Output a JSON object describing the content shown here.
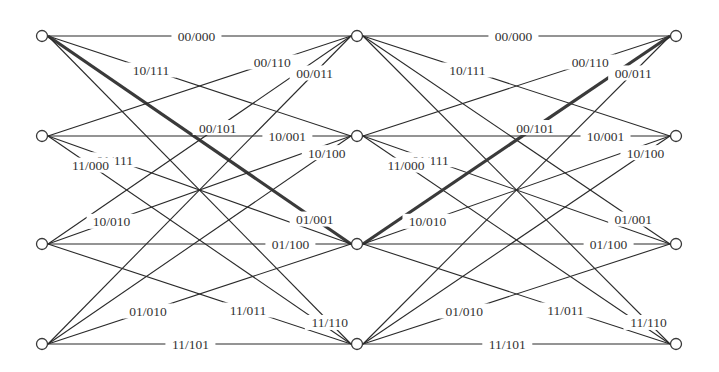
{
  "diagram": {
    "type": "trellis",
    "states": [
      "S0",
      "S1",
      "S2",
      "S3"
    ],
    "columns": [
      {
        "x": 42,
        "label": "t0"
      },
      {
        "x": 357,
        "label": "t1"
      },
      {
        "x": 676,
        "label": "t2"
      }
    ],
    "rows_y": [
      36,
      136,
      244,
      344
    ],
    "colors": {
      "line": "#2a2a2a",
      "text": "#333333",
      "node_fill": "#ffffff"
    },
    "transitions": [
      {
        "from": 0,
        "to": 0,
        "label": "00/000",
        "t": 0.49
      },
      {
        "from": 0,
        "to": 1,
        "label": "10/111",
        "t": 0.34
      },
      {
        "from": 0,
        "to": 2,
        "label": "01/001",
        "t": 0.88
      },
      {
        "from": 0,
        "to": 3,
        "label": "11/110",
        "t": 0.93
      },
      {
        "from": 1,
        "to": 0,
        "label": "00/110",
        "t": 0.74
      },
      {
        "from": 1,
        "to": 1,
        "label": "10/001",
        "t": 0.79
      },
      {
        "from": 1,
        "to": 2,
        "label": "01/111",
        "t": 0.22
      },
      {
        "from": 1,
        "to": 3,
        "label": "11/000",
        "t": 0.14
      },
      {
        "from": 2,
        "to": 0,
        "label": "00/101",
        "t": 0.56
      },
      {
        "from": 2,
        "to": 1,
        "label": "10/010",
        "t": 0.21
      },
      {
        "from": 2,
        "to": 2,
        "label": "01/100",
        "t": 0.8
      },
      {
        "from": 2,
        "to": 3,
        "label": "11/011",
        "t": 0.66
      },
      {
        "from": 3,
        "to": 0,
        "label": "00/011",
        "t": 0.88
      },
      {
        "from": 3,
        "to": 1,
        "label": "10/100",
        "t": 0.92
      },
      {
        "from": 3,
        "to": 2,
        "label": "01/010",
        "t": 0.33
      },
      {
        "from": 3,
        "to": 3,
        "label": "11/101",
        "t": 0.47
      }
    ],
    "highlighted_path": [
      {
        "stage": 0,
        "from": 0,
        "to": 2,
        "label": "01/001"
      },
      {
        "stage": 1,
        "from": 2,
        "to": 0,
        "label": "00/101"
      }
    ]
  }
}
